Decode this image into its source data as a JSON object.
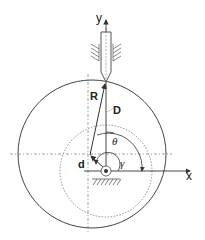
{
  "diagram": {
    "type": "eccentric circular cam with knife-edge translating follower",
    "labels": {
      "y_axis": "y",
      "x_axis": "x",
      "radius": "R",
      "distance": "D",
      "eccentricity": "d",
      "theta": "θ",
      "gamma": "γ"
    },
    "colors": {
      "line": "#333333",
      "dotted": "#777777",
      "background": "#ffffff"
    }
  }
}
